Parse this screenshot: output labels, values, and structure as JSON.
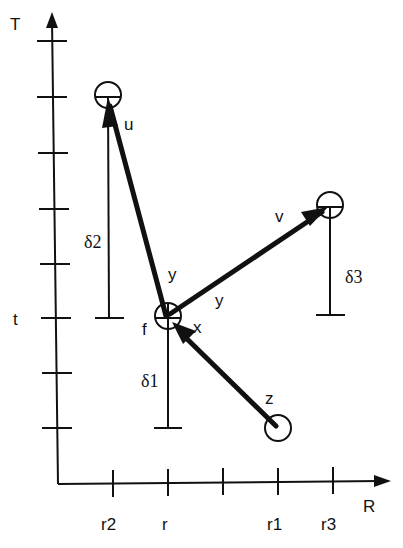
{
  "axes": {
    "y_label": "T",
    "x_label": "R",
    "y_tick_label": "t",
    "x_tick_labels": [
      "r2",
      "r",
      "",
      "r1",
      "r3"
    ]
  },
  "nodes": {
    "u": {
      "label": "u",
      "delta_label": "δ2"
    },
    "f": {
      "label": "f",
      "delta_label": "δ1"
    },
    "v": {
      "label": "v",
      "delta_label": "δ3"
    },
    "z": {
      "label": "z"
    }
  },
  "edges": {
    "f_to_u": {
      "label": "y"
    },
    "f_to_v_near": {
      "label": "y"
    },
    "z_to_f": {
      "label": "x"
    }
  },
  "colors": {
    "ink": "#111111",
    "background": "#ffffff"
  }
}
